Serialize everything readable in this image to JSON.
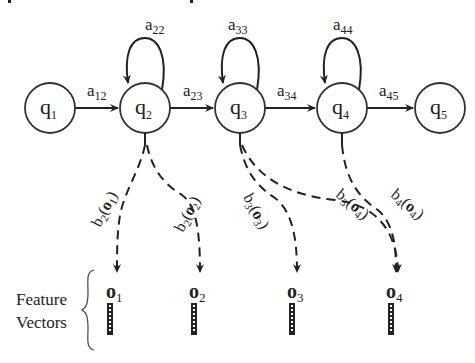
{
  "diagram": {
    "type": "hidden-markov-model",
    "states": [
      {
        "id": "q1",
        "base": "q",
        "sub": "1",
        "cx": 50,
        "cy": 108
      },
      {
        "id": "q2",
        "base": "q",
        "sub": "2",
        "cx": 145,
        "cy": 108
      },
      {
        "id": "q3",
        "base": "q",
        "sub": "3",
        "cx": 240,
        "cy": 108
      },
      {
        "id": "q4",
        "base": "q",
        "sub": "4",
        "cx": 342,
        "cy": 108
      },
      {
        "id": "q5",
        "base": "q",
        "sub": "5",
        "cx": 440,
        "cy": 108
      }
    ],
    "transitions": [
      {
        "from": "q1",
        "to": "q2",
        "base": "a",
        "sub": "12"
      },
      {
        "from": "q2",
        "to": "q3",
        "base": "a",
        "sub": "23"
      },
      {
        "from": "q3",
        "to": "q4",
        "base": "a",
        "sub": "34"
      },
      {
        "from": "q4",
        "to": "q5",
        "base": "a",
        "sub": "45"
      }
    ],
    "self_loops": [
      {
        "state": "q2",
        "base": "a",
        "sub": "22"
      },
      {
        "state": "q3",
        "base": "a",
        "sub": "33"
      },
      {
        "state": "q4",
        "base": "a",
        "sub": "44"
      }
    ],
    "emissions": [
      {
        "from": "q2",
        "to": "o1",
        "fn": "b",
        "fn_sub": "2",
        "arg": "o",
        "arg_sub": "1"
      },
      {
        "from": "q2",
        "to": "o2",
        "fn": "b",
        "fn_sub": "2",
        "arg": "o",
        "arg_sub": "2"
      },
      {
        "from": "q3",
        "to": "o3",
        "fn": "b",
        "fn_sub": "3",
        "arg": "o",
        "arg_sub": "3"
      },
      {
        "from": "q3",
        "to": "o4",
        "fn": "b",
        "fn_sub": "3",
        "arg": "o",
        "arg_sub": "4"
      },
      {
        "from": "q4",
        "to": "o4",
        "fn": "b",
        "fn_sub": "4",
        "arg": "o",
        "arg_sub": "4"
      }
    ],
    "observations": [
      {
        "id": "o1",
        "base": "o",
        "sub": "1",
        "x": 117
      },
      {
        "id": "o2",
        "base": "o",
        "sub": "2",
        "x": 200
      },
      {
        "id": "o3",
        "base": "o",
        "sub": "3",
        "x": 297
      },
      {
        "id": "o4",
        "base": "o",
        "sub": "4",
        "x": 397
      }
    ],
    "feature_label_line1": "Feature",
    "feature_label_line2": "Vectors"
  },
  "labels": {
    "q1": "q",
    "q1s": "1",
    "q2": "q",
    "q2s": "2",
    "q3": "q",
    "q3s": "3",
    "q4": "q",
    "q4s": "4",
    "q5": "q",
    "q5s": "5",
    "a12": "a",
    "a12s": "12",
    "a23": "a",
    "a23s": "23",
    "a34": "a",
    "a34s": "34",
    "a45": "a",
    "a45s": "45",
    "a22": "a",
    "a22s": "22",
    "a33": "a",
    "a33s": "33",
    "a44": "a",
    "a44s": "44",
    "o1": "o",
    "o1s": "1",
    "o2": "o",
    "o2s": "2",
    "o3": "o",
    "o3s": "3",
    "o4": "o",
    "o4s": "4",
    "b2o1": {
      "b": "b",
      "bs": "2",
      "lp": "(",
      "o": "o",
      "os": "1",
      "rp": ")"
    },
    "b2o2": {
      "b": "b",
      "bs": "2",
      "lp": "(",
      "o": "o",
      "os": "2",
      "rp": ")"
    },
    "b3o3": {
      "b": "b",
      "bs": "3",
      "lp": "(",
      "o": "o",
      "os": "3",
      "rp": ")"
    },
    "b3o4": {
      "b": "b",
      "bs": "3",
      "lp": "(",
      "o": "o",
      "os": "4",
      "rp": ")"
    },
    "b4o4": {
      "b": "b",
      "bs": "4",
      "lp": "(",
      "o": "o",
      "os": "4",
      "rp": ")"
    },
    "feature": "Feature",
    "vectors": "Vectors"
  },
  "colors": {
    "ink": "#222222",
    "background": "#ffffff"
  }
}
